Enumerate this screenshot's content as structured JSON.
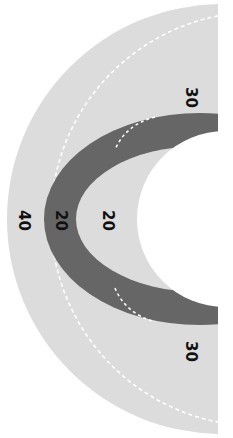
{
  "diagram": {
    "type": "concentric-half-rings",
    "colors": {
      "outer_band": "#dcdcdc",
      "dark_ring": "#666666",
      "inner_band": "#dcdcdc",
      "hole": "#ffffff",
      "dashed_line": "#ffffff",
      "label": "#111111"
    },
    "labels": {
      "outer_top": "30",
      "outer_bottom": "30",
      "outer_left": "40",
      "dark_ring": "20",
      "inner_band": "20"
    }
  }
}
